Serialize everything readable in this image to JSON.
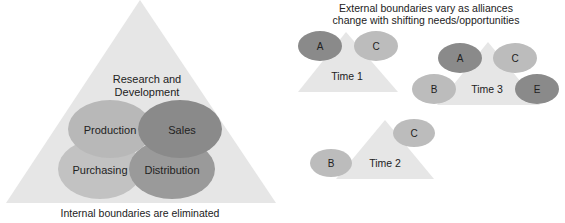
{
  "left_diagram": {
    "caption": "Internal boundaries are eliminated",
    "center_label_line1": "Research and",
    "center_label_line2": "Development",
    "ovals": [
      {
        "label": "Production",
        "color": "#b8b8b8"
      },
      {
        "label": "Sales",
        "color": "#8a8a8a"
      },
      {
        "label": "Purchasing",
        "color": "#c2c2c2"
      },
      {
        "label": "Distribution",
        "color": "#9a9a9a"
      }
    ],
    "triangle_color": "#e6e6e6"
  },
  "right_diagram": {
    "title_line1": "External boundaries vary as alliances",
    "title_line2": "change with shifting needs/opportunities",
    "time1": {
      "label": "Time 1",
      "partners": [
        "A",
        "C"
      ]
    },
    "time2": {
      "label": "Time 2",
      "partners": [
        "B",
        "C"
      ]
    },
    "time3": {
      "label": "Time 3",
      "partners": [
        "A",
        "C",
        "B",
        "E"
      ]
    }
  }
}
